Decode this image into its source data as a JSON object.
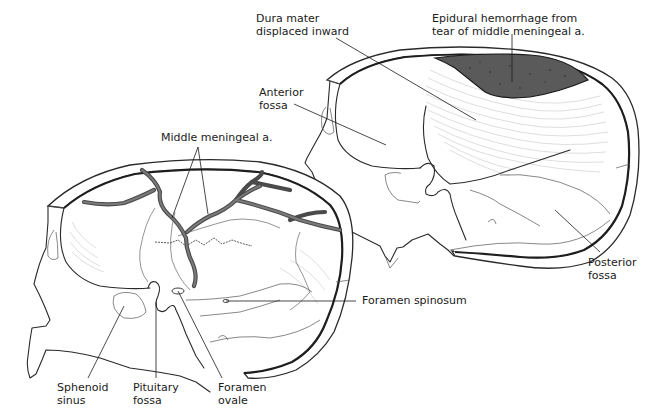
{
  "figure": {
    "type": "anatomical-illustration",
    "colors": {
      "ink": "#1a1a1a",
      "hemorrhage_fill": "#5a5a5a",
      "vessel": "#4a4a4a",
      "background": "#ffffff"
    },
    "left_view": {
      "description": "Lateral interior view of skull with middle meningeal artery branches",
      "labels": [
        {
          "id": "middle-meningeal",
          "text": "Middle meningeal a."
        },
        {
          "id": "foramen-spinosum",
          "text": "Foramen spinosum"
        },
        {
          "id": "sphenoid-sinus",
          "text": "Sphenoid\nsinus"
        },
        {
          "id": "pituitary-fossa",
          "text": "Pituitary\nfossa"
        },
        {
          "id": "foramen-ovale",
          "text": "Foramen\novale"
        }
      ]
    },
    "right_view": {
      "description": "Lateral interior view of skull with epidural hemorrhage displacing dura",
      "labels": [
        {
          "id": "dura-mater",
          "text": "Dura mater\ndisplaced inward"
        },
        {
          "id": "epidural-hemorrhage",
          "text": "Epidural hemorrhage from\ntear of middle meningeal a."
        },
        {
          "id": "anterior-fossa",
          "text": "Anterior\nfossa"
        },
        {
          "id": "posterior-fossa",
          "text": "Posterior\nfossa"
        }
      ]
    }
  }
}
